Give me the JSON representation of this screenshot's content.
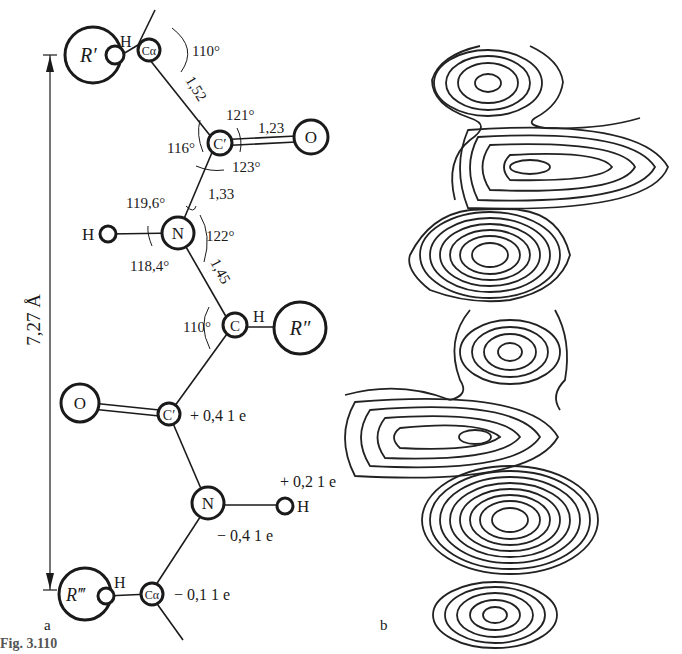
{
  "panel_a": {
    "label": "a",
    "dimension": {
      "label": "7,27 Å"
    },
    "atoms": {
      "r_prime": "R′",
      "h_top": "H",
      "c_alpha_top": "Cα",
      "c_prime_1": "C′",
      "o_1": "O",
      "n_1": "N",
      "h_n1": "H",
      "c_mid": "C",
      "h_mid": "H",
      "r_double_prime": "R″",
      "o_2": "O",
      "c_prime_2": "C′",
      "n_2": "N",
      "h_n2": "H",
      "r_triple_prime": "R‴",
      "h_bottom": "H",
      "c_alpha_bottom": "Cα"
    },
    "bond_lengths": {
      "ca_c": "1,52",
      "c_o": "1,23",
      "c_n": "1,33",
      "n_ca": "1,45"
    },
    "angles": {
      "top": "110°",
      "c_121": "121°",
      "c_116": "116°",
      "c_123": "123°",
      "n_119_6": "119,6°",
      "n_122": "122°",
      "n_118_4": "118,4°",
      "mid_110": "110°"
    },
    "charges": {
      "c_prime": "+ 0,4 1 e",
      "h": "+ 0,2 1 e",
      "n": "− 0,4 1 e",
      "c_alpha": "− 0,1 1 e"
    }
  },
  "panel_b": {
    "label": "b",
    "description": "electron density contour map"
  },
  "caption": {
    "text": "Fig. 3.110"
  }
}
